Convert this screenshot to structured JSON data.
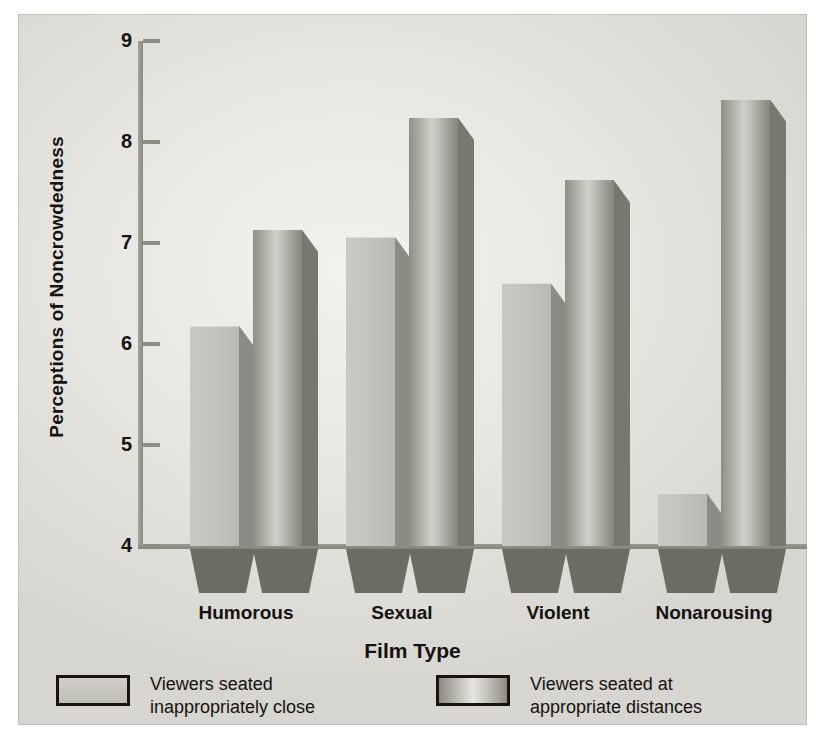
{
  "chart_data": {
    "type": "bar",
    "title": "",
    "xlabel": "Film Type",
    "ylabel": "Perceptions of Noncrowdedness",
    "categories": [
      "Humorous",
      "Sexual",
      "Violent",
      "Nonarousing"
    ],
    "ylim": [
      4,
      9
    ],
    "yticks": [
      9,
      8,
      7,
      6,
      5,
      4
    ],
    "ytick_labels": [
      "9",
      "8",
      "7",
      "6",
      "5",
      "4"
    ],
    "grid": false,
    "legend_position": "bottom",
    "series": [
      {
        "name": "Viewers seated inappropriately close",
        "legend_line1": "Viewers seated",
        "legend_line2": "inappropriately close",
        "values": [
          6.18,
          7.06,
          6.6,
          4.52
        ],
        "swatch": "close"
      },
      {
        "name": "Viewers seated at appropriate distances",
        "legend_line1": "Viewers seated at",
        "legend_line2": "appropriate distances",
        "values": [
          7.13,
          8.24,
          7.62,
          8.42
        ],
        "swatch": "appropriate"
      }
    ]
  },
  "colors": {
    "bar_close": "#c4c3bd",
    "bar_appropriate": "#a8a8a1",
    "shadow": "#6d6c64",
    "axis": "#8d8d86",
    "text": "#15120f",
    "background": "#eae9e5"
  }
}
